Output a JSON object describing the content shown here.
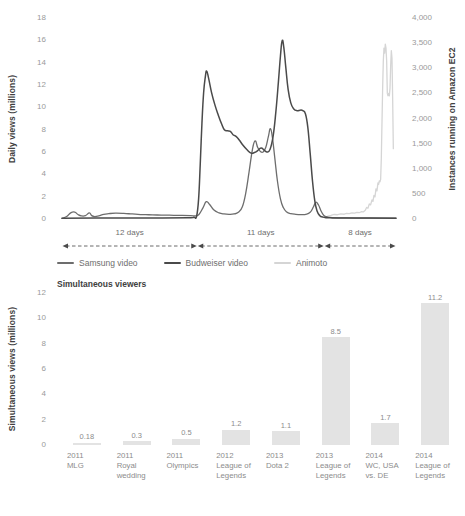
{
  "chart_data": [
    {
      "type": "line",
      "title": "",
      "ylabel": "Daily views (millions)",
      "y2label": "Instances running on Amazon EC2",
      "xlabel": "",
      "ylim": [
        0,
        18
      ],
      "y2lim": [
        0,
        4000
      ],
      "grid": false,
      "legend_position": "bottom",
      "yticks": [
        "0",
        "2",
        "4",
        "6",
        "8",
        "10",
        "12",
        "14",
        "16",
        "18"
      ],
      "y2ticks": [
        "0",
        "500",
        "1,000",
        "1,500",
        "2,000",
        "2,500",
        "3,000",
        "3,500",
        "4,000"
      ],
      "axis_annotations": [
        {
          "label": "12 days",
          "start_pct": 0,
          "end_pct": 40.5
        },
        {
          "label": "11 days",
          "start_pct": 40.5,
          "end_pct": 78.5
        },
        {
          "label": "8 days",
          "start_pct": 78.5,
          "end_pct": 100
        }
      ],
      "series": [
        {
          "name": "Samsung video",
          "color": "#6d6d6d",
          "axis": "left",
          "points": [
            [
              0.0,
              0.05
            ],
            [
              1.4,
              0.22
            ],
            [
              2.6,
              0.55
            ],
            [
              3.8,
              0.62
            ],
            [
              4.8,
              0.4
            ],
            [
              5.8,
              0.28
            ],
            [
              7.0,
              0.3
            ],
            [
              8.2,
              0.55
            ],
            [
              8.9,
              0.3
            ],
            [
              9.8,
              0.22
            ],
            [
              11.0,
              0.28
            ],
            [
              12.5,
              0.42
            ],
            [
              14.0,
              0.48
            ],
            [
              16.0,
              0.52
            ],
            [
              18.5,
              0.5
            ],
            [
              21.0,
              0.45
            ],
            [
              23.5,
              0.4
            ],
            [
              26.0,
              0.38
            ],
            [
              28.5,
              0.36
            ],
            [
              31.0,
              0.35
            ],
            [
              33.5,
              0.33
            ],
            [
              36.0,
              0.32
            ],
            [
              38.5,
              0.3
            ],
            [
              40.0,
              0.28
            ],
            [
              41.0,
              0.4
            ],
            [
              42.2,
              1.0
            ],
            [
              43.2,
              1.55
            ],
            [
              44.2,
              1.3
            ],
            [
              45.5,
              0.8
            ],
            [
              47.0,
              0.55
            ],
            [
              48.5,
              0.45
            ],
            [
              50.0,
              0.42
            ],
            [
              51.5,
              0.45
            ],
            [
              52.8,
              0.6
            ],
            [
              54.0,
              1.1
            ],
            [
              55.0,
              2.3
            ],
            [
              56.0,
              4.2
            ],
            [
              57.0,
              6.2
            ],
            [
              57.8,
              7.0
            ],
            [
              58.6,
              6.4
            ],
            [
              59.4,
              6.05
            ],
            [
              60.2,
              6.0
            ],
            [
              61.0,
              6.4
            ],
            [
              61.8,
              7.4
            ],
            [
              62.4,
              8.1
            ],
            [
              63.0,
              7.3
            ],
            [
              63.7,
              5.5
            ],
            [
              64.5,
              3.4
            ],
            [
              65.4,
              1.8
            ],
            [
              66.3,
              1.0
            ],
            [
              67.3,
              0.62
            ],
            [
              68.5,
              0.48
            ],
            [
              70.0,
              0.42
            ],
            [
              71.5,
              0.4
            ],
            [
              73.0,
              0.42
            ],
            [
              74.3,
              0.6
            ],
            [
              75.3,
              1.1
            ],
            [
              76.0,
              1.5
            ],
            [
              76.8,
              1.25
            ],
            [
              77.6,
              0.7
            ],
            [
              78.4,
              0.32
            ],
            [
              79.5,
              0.18
            ],
            [
              81.0,
              0.12
            ],
            [
              84.0,
              0.1
            ],
            [
              88.0,
              0.08
            ],
            [
              93.0,
              0.08
            ],
            [
              100.0,
              0.07
            ]
          ]
        },
        {
          "name": "Budweiser video",
          "color": "#4a4a4a",
          "axis": "left",
          "points": [
            [
              0.0,
              0.06
            ],
            [
              10.0,
              0.08
            ],
            [
              20.0,
              0.1
            ],
            [
              30.0,
              0.1
            ],
            [
              38.0,
              0.12
            ],
            [
              39.5,
              0.15
            ],
            [
              40.3,
              0.25
            ],
            [
              40.9,
              1.8
            ],
            [
              41.4,
              5.0
            ],
            [
              41.9,
              8.6
            ],
            [
              42.4,
              11.3
            ],
            [
              42.9,
              12.7
            ],
            [
              43.3,
              13.25
            ],
            [
              43.9,
              12.6
            ],
            [
              44.8,
              11.3
            ],
            [
              45.8,
              10.2
            ],
            [
              46.8,
              9.3
            ],
            [
              47.8,
              8.5
            ],
            [
              48.6,
              8.0
            ],
            [
              49.6,
              7.9
            ],
            [
              50.4,
              7.85
            ],
            [
              51.2,
              7.55
            ],
            [
              52.1,
              7.4
            ],
            [
              53.0,
              7.1
            ],
            [
              54.2,
              6.6
            ],
            [
              55.4,
              6.2
            ],
            [
              56.6,
              5.9
            ],
            [
              57.6,
              5.95
            ],
            [
              58.5,
              6.1
            ],
            [
              59.6,
              6.35
            ],
            [
              60.6,
              6.15
            ],
            [
              61.4,
              6.0
            ],
            [
              62.3,
              6.25
            ],
            [
              63.2,
              7.4
            ],
            [
              64.0,
              9.5
            ],
            [
              64.8,
              12.3
            ],
            [
              65.4,
              14.6
            ],
            [
              65.9,
              15.95
            ],
            [
              66.4,
              15.4
            ],
            [
              67.0,
              13.6
            ],
            [
              67.7,
              11.6
            ],
            [
              68.5,
              10.4
            ],
            [
              69.4,
              9.85
            ],
            [
              70.4,
              9.7
            ],
            [
              71.3,
              9.75
            ],
            [
              72.1,
              9.7
            ],
            [
              72.9,
              9.4
            ],
            [
              73.6,
              8.2
            ],
            [
              74.3,
              5.9
            ],
            [
              75.0,
              3.4
            ],
            [
              75.7,
              1.6
            ],
            [
              76.4,
              0.7
            ],
            [
              77.2,
              0.3
            ],
            [
              78.0,
              0.18
            ],
            [
              79.0,
              0.12
            ],
            [
              81.0,
              0.1
            ],
            [
              85.0,
              0.09
            ],
            [
              92.0,
              0.08
            ],
            [
              100.0,
              0.07
            ]
          ]
        },
        {
          "name": "Animoto",
          "color": "#d5d5d5",
          "axis": "right",
          "points": [
            [
              78.5,
              30
            ],
            [
              79.5,
              55
            ],
            [
              80.5,
              70
            ],
            [
              81.5,
              90
            ],
            [
              82.5,
              85
            ],
            [
              83.5,
              100
            ],
            [
              84.5,
              95
            ],
            [
              85.2,
              110
            ],
            [
              86.0,
              105
            ],
            [
              86.8,
              120
            ],
            [
              87.6,
              115
            ],
            [
              88.3,
              130
            ],
            [
              89.0,
              125
            ],
            [
              89.6,
              145
            ],
            [
              90.2,
              140
            ],
            [
              90.8,
              175
            ],
            [
              91.2,
              230
            ],
            [
              91.6,
              215
            ],
            [
              92.0,
              300
            ],
            [
              92.4,
              280
            ],
            [
              92.8,
              380
            ],
            [
              93.1,
              350
            ],
            [
              93.4,
              470
            ],
            [
              93.7,
              440
            ],
            [
              94.0,
              600
            ],
            [
              94.3,
              560
            ],
            [
              94.6,
              720
            ],
            [
              94.8,
              690
            ],
            [
              95.0,
              760
            ],
            [
              95.2,
              740
            ],
            [
              95.4,
              790
            ],
            [
              95.6,
              1200
            ],
            [
              95.8,
              1900
            ],
            [
              96.0,
              2600
            ],
            [
              96.2,
              3150
            ],
            [
              96.4,
              3400
            ],
            [
              96.6,
              3300
            ],
            [
              96.8,
              3480
            ],
            [
              97.0,
              3400
            ],
            [
              97.2,
              3150
            ],
            [
              97.4,
              2500
            ],
            [
              97.6,
              2450
            ],
            [
              97.8,
              2500
            ],
            [
              98.0,
              2450
            ],
            [
              98.2,
              2600
            ],
            [
              98.4,
              3050
            ],
            [
              98.6,
              3350
            ],
            [
              98.8,
              3200
            ],
            [
              99.0,
              2400
            ],
            [
              99.2,
              1400
            ]
          ]
        }
      ]
    },
    {
      "type": "bar",
      "title": "Simultaneous viewers",
      "ylabel": "Simultaneous views (millions)",
      "xlabel": "",
      "ylim": [
        0,
        12
      ],
      "grid": false,
      "yticks": [
        "0",
        "2",
        "4",
        "6",
        "8",
        "10",
        "12"
      ],
      "bar_color": "#e3e3e3",
      "categories": [
        "2011\nMLG",
        "2011\nRoyal\nwedding",
        "2011\nOlympics",
        "2012\nLeague of\nLegends",
        "2013\nDota 2",
        "2013\nLeague of\nLegends",
        "2014\nWC, USA\nvs. DE",
        "2014\nLeague of\nLegends"
      ],
      "values": [
        0.18,
        0.3,
        0.5,
        1.2,
        1.1,
        8.5,
        1.7,
        11.2
      ],
      "value_labels": [
        "0.18",
        "0.3",
        "0.5",
        "1.2",
        "1.1",
        "8.5",
        "1.7",
        "11.2"
      ]
    }
  ]
}
